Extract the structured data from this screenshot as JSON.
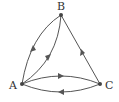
{
  "diagram": {
    "type": "directed-graph",
    "nodes": [
      {
        "id": "B",
        "label": "B",
        "x": 61,
        "y": 15
      },
      {
        "id": "A",
        "label": "A",
        "x": 22,
        "y": 84
      },
      {
        "id": "C",
        "label": "C",
        "x": 100,
        "y": 84
      }
    ],
    "edges": [
      {
        "from": "A",
        "to": "B",
        "shape": "curve-outer"
      },
      {
        "from": "B",
        "to": "A",
        "shape": "curve-inner"
      },
      {
        "from": "C",
        "to": "B",
        "shape": "straight"
      },
      {
        "from": "A",
        "to": "C",
        "shape": "curve-upper"
      },
      {
        "from": "C",
        "to": "A",
        "shape": "curve-lower"
      }
    ],
    "colors": {
      "stroke": "#555555",
      "node": "#444444",
      "label": "#333333"
    }
  }
}
